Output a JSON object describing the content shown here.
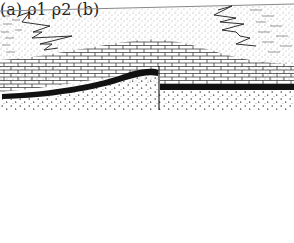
{
  "panel_a": {
    "caption": "(a)",
    "layers": [
      {
        "name": "sandstone",
        "pattern": "stipple",
        "position": "top"
      },
      {
        "name": "shale-interfingering",
        "pattern": "dashes-zigzag",
        "position": "left and right upper"
      },
      {
        "name": "limestone",
        "pattern": "brick",
        "position": "middle, anticline"
      },
      {
        "name": "black-bed",
        "pattern": "solid-black",
        "position": "base of sediments"
      },
      {
        "name": "basement",
        "pattern": "crosses-dots",
        "position": "bottom"
      }
    ],
    "features": [
      "anticline",
      "normal-fault",
      "facies-interfingering"
    ]
  },
  "panel_b": {
    "caption": "(b)",
    "upper_density_label": "ρ",
    "upper_density_sub": "1",
    "lower_density_label": "ρ",
    "lower_density_sub": "2",
    "interface": "anticline-shaped hatched boundary"
  },
  "colors": {
    "ink": "#1a1a1a",
    "paper": "#ffffff",
    "line_gray": "#8a8a8a"
  }
}
